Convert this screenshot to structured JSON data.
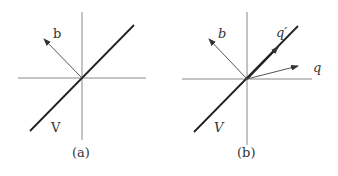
{
  "panels": [
    {
      "caption": "(a)",
      "vector_label": "b",
      "subspace_label": "V"
    },
    {
      "caption": "(b)",
      "vector_label": "b",
      "subspace_label": "V",
      "q_label": "q",
      "q_prime_label": "q′"
    }
  ],
  "colors": {
    "axis": "#777777",
    "subspace": "#222222",
    "vector": "#555555"
  }
}
